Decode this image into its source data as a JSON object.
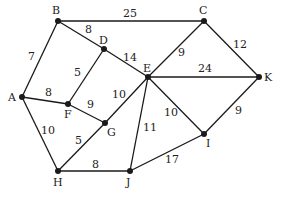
{
  "diagram": {
    "type": "weighted-undirected-graph",
    "nodes": [
      {
        "id": "A",
        "x": 22,
        "y": 97,
        "lx": 8,
        "ly": 101
      },
      {
        "id": "B",
        "x": 58,
        "y": 21,
        "lx": 52,
        "ly": 14
      },
      {
        "id": "C",
        "x": 204,
        "y": 21,
        "lx": 199,
        "ly": 14
      },
      {
        "id": "D",
        "x": 104,
        "y": 49,
        "lx": 99,
        "ly": 44
      },
      {
        "id": "E",
        "x": 148,
        "y": 77,
        "lx": 143,
        "ly": 72
      },
      {
        "id": "F",
        "x": 68,
        "y": 104,
        "lx": 64,
        "ly": 118
      },
      {
        "id": "G",
        "x": 105,
        "y": 123,
        "lx": 107,
        "ly": 136
      },
      {
        "id": "H",
        "x": 58,
        "y": 171,
        "lx": 53,
        "ly": 186
      },
      {
        "id": "I",
        "x": 204,
        "y": 134,
        "lx": 206,
        "ly": 147
      },
      {
        "id": "J",
        "x": 130,
        "y": 171,
        "lx": 126,
        "ly": 186
      },
      {
        "id": "K",
        "x": 259,
        "y": 77,
        "lx": 264,
        "ly": 81
      }
    ],
    "edges": [
      {
        "from": "A",
        "to": "B",
        "weight": "7",
        "lx": 28,
        "ly": 60
      },
      {
        "from": "B",
        "to": "C",
        "weight": "25",
        "lx": 123,
        "ly": 17
      },
      {
        "from": "B",
        "to": "D",
        "weight": "8",
        "lx": 85,
        "ly": 33
      },
      {
        "from": "D",
        "to": "E",
        "weight": "14",
        "lx": 123,
        "ly": 61
      },
      {
        "from": "D",
        "to": "F",
        "weight": "5",
        "lx": 74,
        "ly": 76
      },
      {
        "from": "A",
        "to": "F",
        "weight": "8",
        "lx": 45,
        "ly": 96
      },
      {
        "from": "F",
        "to": "G",
        "weight": "9",
        "lx": 87,
        "ly": 108
      },
      {
        "from": "G",
        "to": "E",
        "weight": "10",
        "lx": 112,
        "ly": 98
      },
      {
        "from": "C",
        "to": "E",
        "weight": "9",
        "lx": 178,
        "ly": 56
      },
      {
        "from": "C",
        "to": "K",
        "weight": "12",
        "lx": 233,
        "ly": 48
      },
      {
        "from": "E",
        "to": "K",
        "weight": "24",
        "lx": 198,
        "ly": 72
      },
      {
        "from": "E",
        "to": "J",
        "weight": "11",
        "lx": 143,
        "ly": 131
      },
      {
        "from": "E",
        "to": "I",
        "weight": "10",
        "lx": 164,
        "ly": 116
      },
      {
        "from": "K",
        "to": "I",
        "weight": "9",
        "lx": 235,
        "ly": 114
      },
      {
        "from": "A",
        "to": "H",
        "weight": "10",
        "lx": 41,
        "ly": 134
      },
      {
        "from": "G",
        "to": "H",
        "weight": "5",
        "lx": 75,
        "ly": 144
      },
      {
        "from": "H",
        "to": "J",
        "weight": "8",
        "lx": 92,
        "ly": 168
      },
      {
        "from": "J",
        "to": "I",
        "weight": "17",
        "lx": 165,
        "ly": 163
      }
    ]
  }
}
